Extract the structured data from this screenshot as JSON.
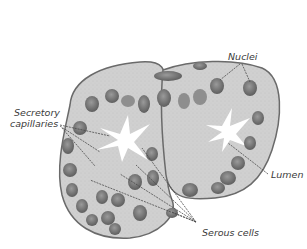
{
  "figure": {
    "labels": {
      "nuclei": "Nuclei",
      "secretory_capillaries_line1": "Secretory",
      "secretory_capillaries_line2": "capillaries",
      "lumen": "Lumen",
      "serous_cells": "Serous cells"
    },
    "colors": {
      "background": "#ffffff",
      "cytoplasm": "#cfcfcf",
      "membrane": "#6a6a6a",
      "nucleus": "#7c7c7c",
      "nucleus_dark": "#555555",
      "lumen": "#ffffff",
      "leader_line": "#4a4a4a",
      "text": "#3a3a3a"
    }
  }
}
